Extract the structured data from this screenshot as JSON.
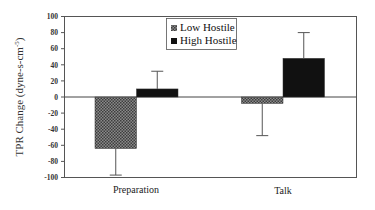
{
  "chart_data": {
    "type": "bar",
    "title": "",
    "xlabel": "",
    "ylabel": "TPR Change (dyne-s-cm",
    "ylabel_superscript": "-5",
    "ylabel_suffix": ")",
    "ylim": [
      -100,
      100
    ],
    "yticks": [
      100,
      80,
      60,
      40,
      20,
      0,
      -20,
      -40,
      -60,
      -80,
      -100
    ],
    "grid": false,
    "legend_position": "top-center (inside plot)",
    "categories": [
      "Preparation",
      "Talk"
    ],
    "series": [
      {
        "name": "Low Hostile",
        "fill": "crosshatch-gray",
        "values": [
          -64,
          -8
        ],
        "error_bar_ends": [
          -97,
          -48
        ]
      },
      {
        "name": "High Hostile",
        "fill": "#111111",
        "values": [
          10,
          48
        ],
        "error_bar_ends": [
          32,
          80
        ]
      }
    ]
  },
  "colors": {
    "low_hostile": "#6a6a6a",
    "high_hostile": "#111111",
    "axis": "#555555"
  }
}
